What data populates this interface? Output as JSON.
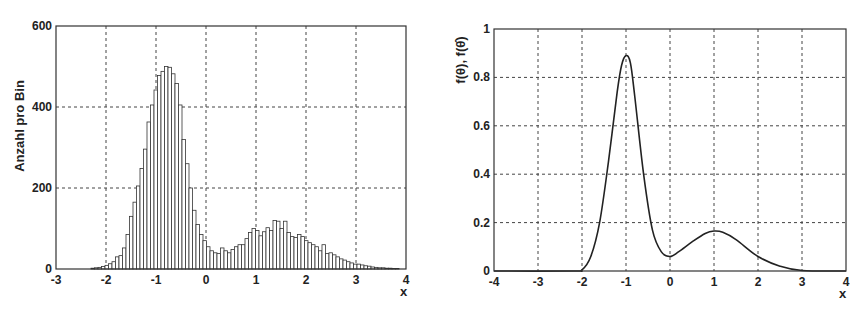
{
  "chart_data": [
    {
      "type": "bar",
      "title": "",
      "xlabel": "x",
      "ylabel": "Anzahl pro Bin",
      "xlim": [
        -3,
        4
      ],
      "ylim": [
        0,
        600
      ],
      "grid": true,
      "xticks": [
        "-3",
        "-2",
        "-1",
        "0",
        "1",
        "2",
        "3",
        "4"
      ],
      "yticks": [
        "0",
        "200",
        "400",
        "600"
      ],
      "bin_width": 0.07,
      "bin_start": -2.3,
      "values": [
        2,
        3,
        4,
        6,
        9,
        13,
        18,
        30,
        33,
        52,
        85,
        130,
        165,
        205,
        248,
        296,
        363,
        405,
        442,
        478,
        488,
        500,
        498,
        482,
        458,
        405,
        320,
        260,
        200,
        145,
        110,
        85,
        70,
        55,
        45,
        40,
        38,
        52,
        45,
        40,
        48,
        55,
        60,
        60,
        75,
        90,
        100,
        95,
        82,
        92,
        102,
        95,
        120,
        118,
        100,
        118,
        90,
        80,
        78,
        85,
        80,
        70,
        65,
        60,
        55,
        45,
        60,
        38,
        40,
        35,
        30,
        25,
        22,
        18,
        15,
        12,
        12,
        10,
        8,
        7,
        5,
        4,
        3,
        3,
        2,
        2,
        1,
        1
      ],
      "peak_annotation": "max ~500 at x≈-0.95; secondary max ~120 at x≈1.0"
    },
    {
      "type": "line",
      "title": "",
      "xlabel": "x",
      "ylabel": "f(θ), f(θ̂)",
      "xlim": [
        -4,
        4
      ],
      "ylim": [
        0,
        1
      ],
      "grid": true,
      "xticks": [
        "-4",
        "-3",
        "-2",
        "-1",
        "0",
        "1",
        "2",
        "3",
        "4"
      ],
      "yticks": [
        "0",
        "0.2",
        "0.4",
        "0.6",
        "0.8",
        "1"
      ],
      "series": [
        {
          "name": "f(θ)",
          "x": [
            -4,
            -2.2,
            -2,
            -1.8,
            -1.6,
            -1.4,
            -1.2,
            -1.1,
            -1.0,
            -0.9,
            -0.8,
            -0.6,
            -0.4,
            -0.2,
            0,
            0.2,
            0.5,
            0.8,
            1.0,
            1.2,
            1.5,
            2.0,
            2.5,
            3.0,
            4.0
          ],
          "y": [
            0,
            0,
            0.005,
            0.06,
            0.2,
            0.45,
            0.74,
            0.85,
            0.89,
            0.86,
            0.72,
            0.4,
            0.17,
            0.08,
            0.06,
            0.08,
            0.12,
            0.155,
            0.165,
            0.16,
            0.13,
            0.06,
            0.02,
            0.002,
            0
          ]
        }
      ]
    }
  ],
  "left_plot": {
    "ylabel": "Anzahl pro Bin",
    "xlabel": "x",
    "xticks": [
      "-3",
      "-2",
      "-1",
      "0",
      "1",
      "2",
      "3",
      "4"
    ],
    "yticks": [
      "0",
      "200",
      "400",
      "600"
    ]
  },
  "right_plot": {
    "ylabel": "f(θ), f(θ̂)",
    "xlabel": "x",
    "xticks": [
      "-4",
      "-3",
      "-2",
      "-1",
      "0",
      "1",
      "2",
      "3",
      "4"
    ],
    "yticks": [
      "0",
      "0.2",
      "0.4",
      "0.6",
      "0.8",
      "1"
    ]
  }
}
